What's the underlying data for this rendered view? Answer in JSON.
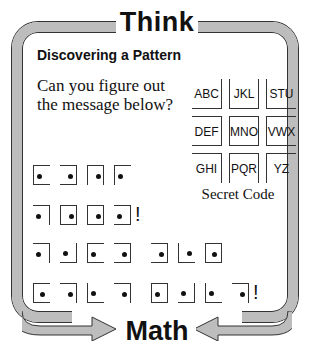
{
  "header": {
    "title_top": "Think",
    "title_bottom": "Math"
  },
  "section": {
    "subtitle": "Discovering a Pattern",
    "question": "Can you figure out the message below?"
  },
  "secret_code": {
    "caption": "Secret Code",
    "cells": [
      {
        "label": "ABC",
        "borders": "rb"
      },
      {
        "label": "JKL",
        "borders": "lrb"
      },
      {
        "label": "STU",
        "borders": "lb"
      },
      {
        "label": "DEF",
        "borders": "trb"
      },
      {
        "label": "MNO",
        "borders": "trbl"
      },
      {
        "label": "VWX",
        "borders": "tlb"
      },
      {
        "label": "GHI",
        "borders": "tr"
      },
      {
        "label": "PQR",
        "borders": "ltr"
      },
      {
        "label": "YZ",
        "borders": "lt"
      }
    ]
  },
  "message_rows": [
    {
      "symbols": [
        "tlb:l",
        "trb:r",
        "tlr:r",
        "lt:l"
      ],
      "end": ""
    },
    {
      "symbols": [
        "tr:l",
        "trbl:r",
        "trbl:r",
        "trb:l"
      ],
      "end": "!"
    },
    {
      "symbols": [
        "tr:l",
        "rb:l",
        "tlb:l",
        "trb:r",
        " ",
        "trb:r",
        "lb:r",
        "trbl:c"
      ],
      "end": ""
    },
    {
      "symbols": [
        "tlb:c",
        "tr:r",
        "lb:l",
        "tr:r",
        " ",
        "trbl:l",
        "rb:l",
        "lb:l",
        "tr:r"
      ],
      "end": "!"
    }
  ],
  "colors": {
    "frame": "#bdbdbd",
    "ink": "#111111"
  }
}
